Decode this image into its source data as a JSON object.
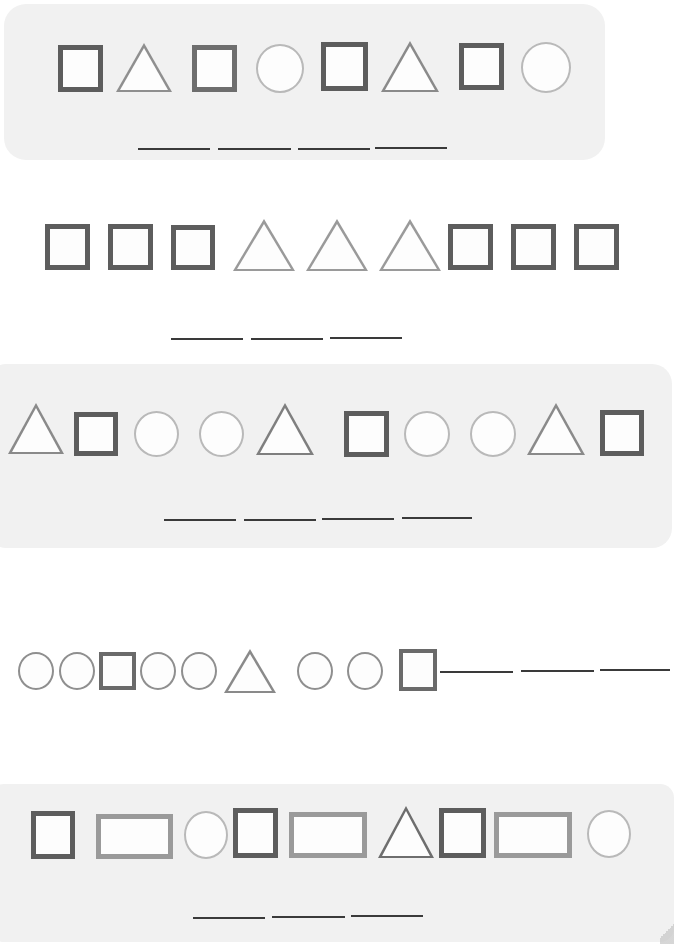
{
  "worksheet": {
    "title": "Shape Pattern Worksheet",
    "background_color": "#ffffff",
    "panel_tint_color": "#f1f1f1",
    "blank_line_color": "#3a3a3a",
    "shape_colors": {
      "square_dark": "#5d5d5d",
      "square_gray": "#8a8a8a",
      "rectangle_gray": "#9a9a9a",
      "circle_light": "#b9b9b9",
      "triangle_gray": "#8f8f8f"
    }
  },
  "rows": [
    {
      "id": "row-1",
      "panel": "tinted",
      "sequence": [
        "square",
        "triangle",
        "square",
        "circle",
        "square",
        "triangle",
        "square",
        "circle"
      ],
      "unit": [
        "square",
        "triangle",
        "square",
        "circle"
      ],
      "blank_count": 4,
      "blanks_position": "below"
    },
    {
      "id": "row-2",
      "panel": "none",
      "sequence": [
        "square",
        "square",
        "square",
        "triangle",
        "triangle",
        "triangle",
        "square",
        "square",
        "square"
      ],
      "unit": [
        "square",
        "square",
        "square"
      ],
      "blank_count": 3,
      "blanks_position": "below"
    },
    {
      "id": "row-3",
      "panel": "tinted",
      "sequence": [
        "triangle",
        "square",
        "circle",
        "circle",
        "triangle",
        "square",
        "circle",
        "circle",
        "triangle",
        "square"
      ],
      "unit": [
        "triangle",
        "square",
        "circle",
        "circle"
      ],
      "blank_count": 4,
      "blanks_position": "below"
    },
    {
      "id": "row-4",
      "panel": "none",
      "sequence": [
        "circle",
        "circle",
        "square",
        "circle",
        "circle",
        "triangle",
        "circle",
        "circle",
        "square"
      ],
      "unit": [
        "circle",
        "circle",
        "square"
      ],
      "blank_count": 3,
      "blanks_position": "inline"
    },
    {
      "id": "row-5",
      "panel": "tinted",
      "sequence": [
        "square",
        "rectangle",
        "circle",
        "square",
        "rectangle",
        "triangle",
        "square",
        "rectangle",
        "circle"
      ],
      "unit": [
        "square",
        "rectangle",
        "circle"
      ],
      "blank_count": 3,
      "blanks_position": "below"
    }
  ]
}
